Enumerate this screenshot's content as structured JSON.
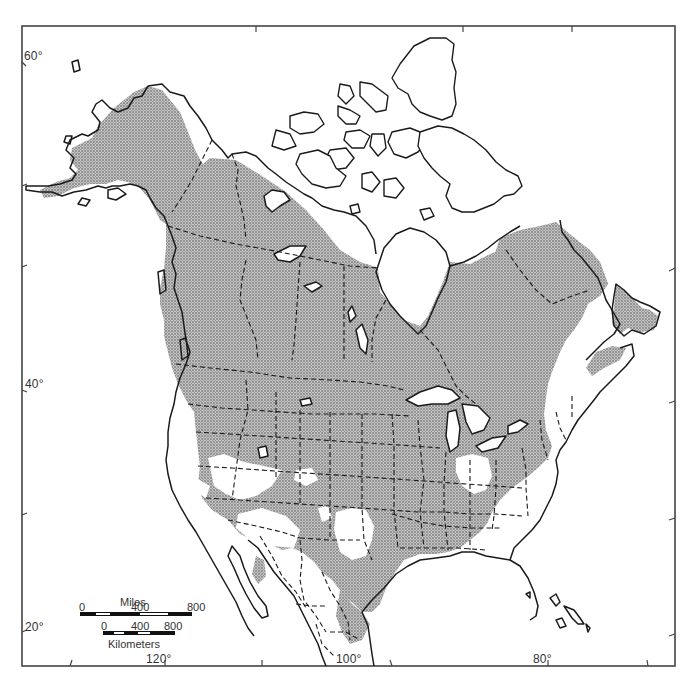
{
  "map": {
    "title": "",
    "subject": "Species range map of North America (stippled = distribution)",
    "colors": {
      "background": "#ffffff",
      "land_outline": "#1a1a1a",
      "range_fill": "#b9b9b9",
      "range_stipple": "#555555",
      "frame": "#444444"
    },
    "latitude_labels": [
      {
        "text": "60°",
        "x": 24,
        "y": 62
      },
      {
        "text": "40°",
        "x": 24,
        "y": 390
      },
      {
        "text": "20°",
        "x": 24,
        "y": 632
      }
    ],
    "longitude_labels": [
      {
        "text": "120°",
        "x": 148,
        "y": 652
      },
      {
        "text": "100°",
        "x": 335,
        "y": 652
      },
      {
        "text": "80°",
        "x": 533,
        "y": 652
      }
    ],
    "frame": {
      "left": 22,
      "top": 26,
      "right": 675,
      "bottom": 666
    },
    "ticks": {
      "top": [
        256,
        463,
        572
      ],
      "bottom": [
        70,
        165,
        262,
        392,
        548,
        648
      ],
      "left": [
        62,
        186,
        267,
        390,
        515,
        632
      ],
      "right": [
        268,
        401,
        518,
        634
      ]
    },
    "scale_bar": {
      "miles_label": "Miles",
      "miles_ticks": [
        "0",
        "400",
        "800"
      ],
      "km_label": "Kilometers",
      "km_ticks": [
        "0",
        "400",
        "800"
      ]
    },
    "range_summary": {
      "included": [
        "Alaska (interior & west)",
        "Yukon",
        "Northwest Territories (south)",
        "British Columbia",
        "Alberta",
        "Saskatchewan",
        "Manitoba",
        "Ontario",
        "Quebec",
        "Labrador",
        "Newfoundland",
        "Maritimes",
        "Most of contiguous United States",
        "Northeastern Mexico"
      ],
      "excluded": [
        "Arctic Archipelago",
        "Hudson Bay coast",
        "Great Basin deserts",
        "Southern Texas / New Mexico plains",
        "Ohio / Indiana patch",
        "South Carolina patch",
        "Florida peninsula south",
        "Most of Mexico"
      ]
    }
  }
}
